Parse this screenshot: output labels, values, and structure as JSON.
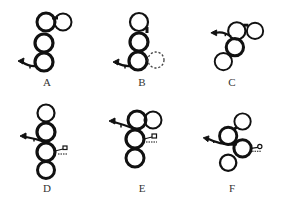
{
  "diagram": {
    "panels": [
      {
        "label": "A",
        "circles": [
          {
            "cx": 46,
            "cy": 22,
            "bold": true
          },
          {
            "cx": 63,
            "cy": 22,
            "bold": false
          },
          {
            "cx": 44,
            "cy": 43,
            "bold": true
          },
          {
            "cx": 44,
            "cy": 62,
            "bold": true
          }
        ],
        "arrow": {
          "from": [
            38,
            66
          ],
          "to": [
            19,
            61
          ]
        },
        "key": null,
        "dashed_circle": null
      },
      {
        "label": "B",
        "circles": [
          {
            "cx": 44,
            "cy": 22,
            "bold": false
          },
          {
            "cx": 44,
            "cy": 42,
            "bold": true
          },
          {
            "cx": 43,
            "cy": 61,
            "bold": true
          }
        ],
        "arrow": {
          "from": [
            38,
            66
          ],
          "to": [
            19,
            62
          ]
        },
        "key": null,
        "dashed_circle": {
          "cx": 61,
          "cy": 60
        }
      },
      {
        "label": "C",
        "circles": [
          {
            "cx": 54,
            "cy": 30,
            "bold": false
          },
          {
            "cx": 73,
            "cy": 30,
            "bold": false
          },
          {
            "cx": 52,
            "cy": 47,
            "bold": true
          },
          {
            "cx": 40,
            "cy": 62,
            "bold": false
          }
        ],
        "arrow": {
          "from": [
            50,
            34
          ],
          "to": [
            28,
            32
          ]
        },
        "key": null,
        "dashed_circle": null
      },
      {
        "label": "D",
        "circles": [
          {
            "cx": 46,
            "cy": 8,
            "bold": false
          },
          {
            "cx": 46,
            "cy": 27,
            "bold": true
          },
          {
            "cx": 46,
            "cy": 47,
            "bold": true
          },
          {
            "cx": 46,
            "cy": 65,
            "bold": true
          }
        ],
        "arrow": {
          "from": [
            46,
            36
          ],
          "to": [
            21,
            31
          ]
        },
        "key": {
          "x": 57,
          "y": 46
        },
        "dashed_circle": null
      },
      {
        "label": "E",
        "circles": [
          {
            "cx": 42,
            "cy": 15,
            "bold": true
          },
          {
            "cx": 58,
            "cy": 15,
            "bold": false
          },
          {
            "cx": 40,
            "cy": 34,
            "bold": true
          },
          {
            "cx": 40,
            "cy": 53,
            "bold": true
          }
        ],
        "arrow": {
          "from": [
            38,
            22
          ],
          "to": [
            14,
            16
          ]
        },
        "key": {
          "x": 49,
          "y": 33
        },
        "dashed_circle": null
      },
      {
        "label": "F",
        "circles": [
          {
            "cx": 60,
            "cy": 15,
            "bold": false
          },
          {
            "cx": 45,
            "cy": 30,
            "bold": true
          },
          {
            "cx": 60,
            "cy": 43,
            "bold": true
          },
          {
            "cx": 45,
            "cy": 58,
            "bold": true
          }
        ],
        "arrow": {
          "from": [
            54,
            39
          ],
          "to": [
            20,
            33
          ]
        },
        "key": {
          "x": 72,
          "y": 42
        },
        "dashed_circle": null
      }
    ]
  }
}
